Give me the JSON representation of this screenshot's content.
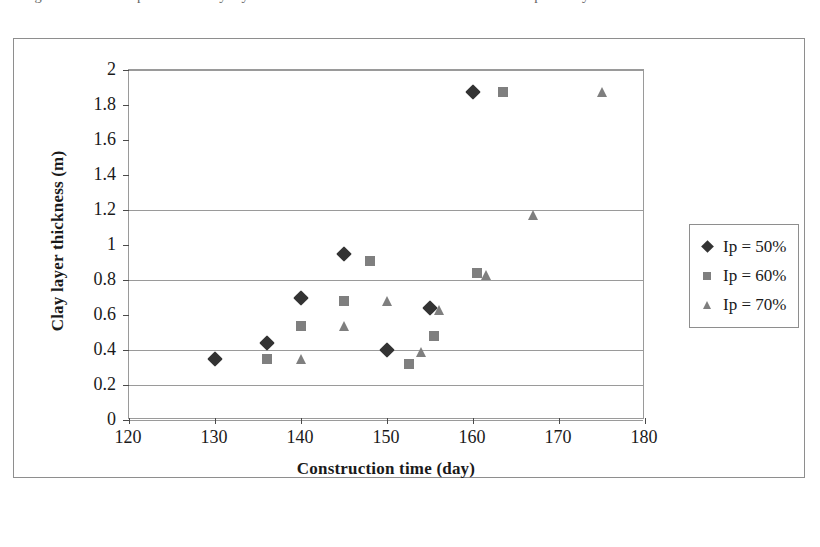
{
  "caption": {
    "clipped_line": "Figure. Relationship between clay layer thickness and construction time for different plasticity index"
  },
  "legend": {
    "position": "right",
    "entries": [
      {
        "label": "Ip = 50%",
        "marker": "diamond",
        "color": "#333333"
      },
      {
        "label": "Ip = 60%",
        "marker": "square",
        "color": "#7f7f7f"
      },
      {
        "label": "Ip = 70%",
        "marker": "triangle",
        "color": "#7f7f7f"
      }
    ]
  },
  "chart_data": {
    "type": "scatter",
    "title": "",
    "xlabel": "Construction time (day)",
    "ylabel": "Clay layer thickness (m)",
    "xlim": [
      120,
      180
    ],
    "ylim": [
      0,
      2
    ],
    "xticks": [
      120,
      130,
      140,
      150,
      160,
      170,
      180
    ],
    "yticks": [
      0,
      0.2,
      0.4,
      0.6,
      0.8,
      1,
      1.2,
      1.4,
      1.6,
      1.8,
      2
    ],
    "ytick_labels": [
      "0",
      "0.2",
      "0.4",
      "0.6",
      "0.8",
      "1",
      "1.2",
      "1.4",
      "1.6",
      "1.8",
      "2"
    ],
    "gridlines_y": [
      0,
      0.2,
      0.4,
      0.8,
      1.2,
      2
    ],
    "grid": true,
    "legend_position": "right",
    "series": [
      {
        "name": "Ip = 50%",
        "marker": "diamond",
        "color": "#333333",
        "points": [
          [
            130,
            0.35
          ],
          [
            136,
            0.44
          ],
          [
            140,
            0.7
          ],
          [
            145,
            0.95
          ],
          [
            150,
            0.4
          ],
          [
            155,
            0.64
          ],
          [
            160,
            1.875
          ]
        ]
      },
      {
        "name": "Ip = 60%",
        "marker": "square",
        "color": "#7f7f7f",
        "points": [
          [
            136,
            0.35
          ],
          [
            140,
            0.54
          ],
          [
            145,
            0.68
          ],
          [
            148,
            0.91
          ],
          [
            152.5,
            0.32
          ],
          [
            155.5,
            0.48
          ],
          [
            160.5,
            0.84
          ],
          [
            163.5,
            1.875
          ]
        ]
      },
      {
        "name": "Ip = 70%",
        "marker": "triangle",
        "color": "#7f7f7f",
        "points": [
          [
            140,
            0.35
          ],
          [
            145,
            0.54
          ],
          [
            150,
            0.68
          ],
          [
            154,
            0.39
          ],
          [
            156,
            0.63
          ],
          [
            161.5,
            0.83
          ],
          [
            167,
            1.17
          ],
          [
            175,
            1.875
          ]
        ]
      }
    ]
  }
}
